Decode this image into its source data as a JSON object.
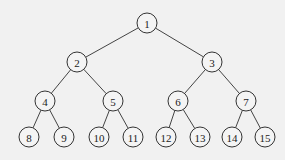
{
  "diagram": {
    "type": "complete-binary-tree",
    "nodes": [
      {
        "id": 1,
        "label": "1",
        "x": 147,
        "y": 23
      },
      {
        "id": 2,
        "label": "2",
        "x": 77,
        "y": 62
      },
      {
        "id": 3,
        "label": "3",
        "x": 212,
        "y": 62
      },
      {
        "id": 4,
        "label": "4",
        "x": 45,
        "y": 101
      },
      {
        "id": 5,
        "label": "5",
        "x": 113,
        "y": 101
      },
      {
        "id": 6,
        "label": "6",
        "x": 178,
        "y": 101
      },
      {
        "id": 7,
        "label": "7",
        "x": 246,
        "y": 101
      },
      {
        "id": 8,
        "label": "8",
        "x": 29,
        "y": 137
      },
      {
        "id": 9,
        "label": "9",
        "x": 64,
        "y": 137
      },
      {
        "id": 10,
        "label": "10",
        "x": 99,
        "y": 137
      },
      {
        "id": 11,
        "label": "11",
        "x": 133,
        "y": 137
      },
      {
        "id": 12,
        "label": "12",
        "x": 166,
        "y": 137
      },
      {
        "id": 13,
        "label": "13",
        "x": 200,
        "y": 137
      },
      {
        "id": 14,
        "label": "14",
        "x": 232,
        "y": 137
      },
      {
        "id": 15,
        "label": "15",
        "x": 265,
        "y": 137
      }
    ],
    "edges": [
      [
        1,
        2
      ],
      [
        1,
        3
      ],
      [
        2,
        4
      ],
      [
        2,
        5
      ],
      [
        3,
        6
      ],
      [
        3,
        7
      ],
      [
        4,
        8
      ],
      [
        4,
        9
      ],
      [
        5,
        10
      ],
      [
        5,
        11
      ],
      [
        6,
        12
      ],
      [
        6,
        13
      ],
      [
        7,
        14
      ],
      [
        7,
        15
      ]
    ],
    "node_radius": 10
  }
}
